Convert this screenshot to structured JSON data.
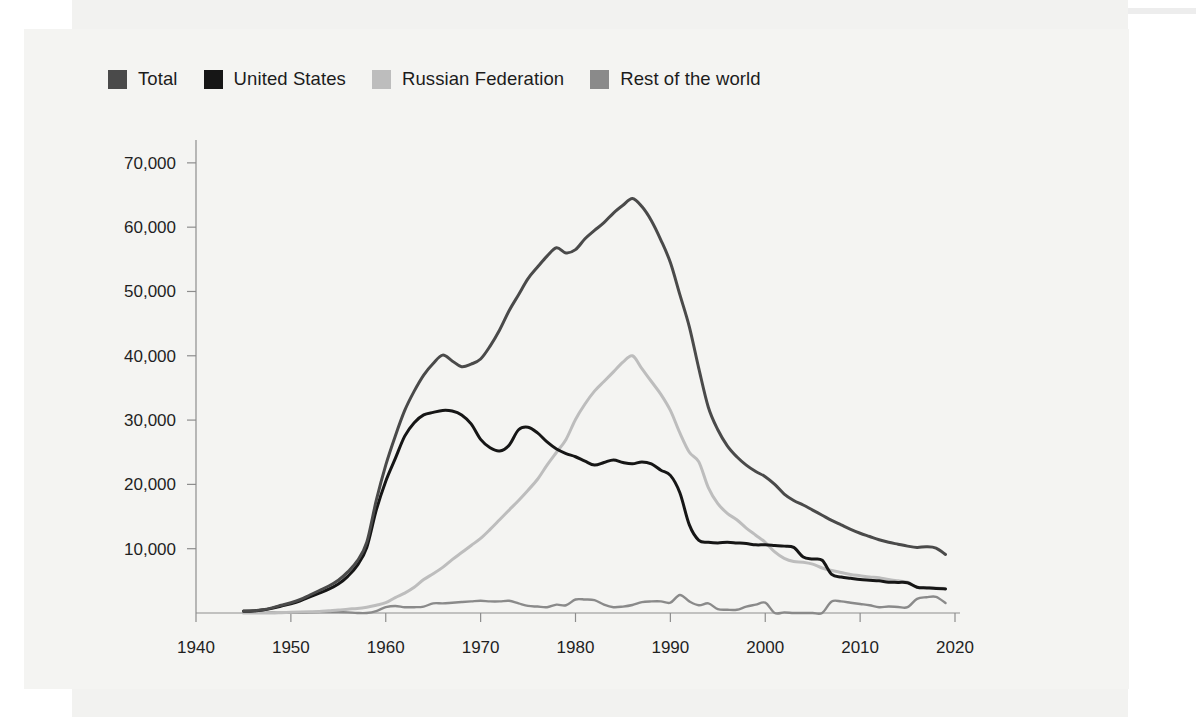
{
  "legend": {
    "position": "top-left",
    "items": [
      {
        "label": "Total",
        "color": "#4a4a4a",
        "key": "total"
      },
      {
        "label": "United States",
        "color": "#161616",
        "key": "united_states"
      },
      {
        "label": "Russian Federation",
        "color": "#bdbdbd",
        "key": "russian_federation"
      },
      {
        "label": "Rest of the world",
        "color": "#8a8a8a",
        "key": "rest_of_world"
      }
    ]
  },
  "axes": {
    "x_ticks": [
      "1940",
      "1950",
      "1960",
      "1970",
      "1980",
      "1990",
      "2000",
      "2010",
      "2020"
    ],
    "y_ticks": [
      "10,000",
      "20,000",
      "30,000",
      "40,000",
      "50,000",
      "60,000",
      "70,000"
    ],
    "xlim": [
      1940,
      2020
    ],
    "ylim": [
      0,
      72000
    ],
    "xlabel": "",
    "ylabel": ""
  },
  "chart_data": {
    "type": "line",
    "title": "",
    "subtitle": "",
    "xlabel": "",
    "ylabel": "",
    "xlim": [
      1940,
      2020
    ],
    "ylim": [
      0,
      72000
    ],
    "grid": false,
    "legend_position": "top-left",
    "x_tick_labels": [
      "1940",
      "1950",
      "1960",
      "1970",
      "1980",
      "1990",
      "2000",
      "2010",
      "2020"
    ],
    "y_tick_labels": [
      "10,000",
      "20,000",
      "30,000",
      "40,000",
      "50,000",
      "60,000",
      "70,000"
    ],
    "x": [
      1945,
      1946,
      1947,
      1948,
      1949,
      1950,
      1951,
      1952,
      1953,
      1954,
      1955,
      1956,
      1957,
      1958,
      1959,
      1960,
      1961,
      1962,
      1963,
      1964,
      1965,
      1966,
      1967,
      1968,
      1969,
      1970,
      1971,
      1972,
      1973,
      1974,
      1975,
      1976,
      1977,
      1978,
      1979,
      1980,
      1981,
      1982,
      1983,
      1984,
      1985,
      1986,
      1987,
      1988,
      1989,
      1990,
      1991,
      1992,
      1993,
      1994,
      1995,
      1996,
      1997,
      1998,
      1999,
      2000,
      2001,
      2002,
      2003,
      2004,
      2005,
      2006,
      2007,
      2008,
      2009,
      2010,
      2011,
      2012,
      2013,
      2014,
      2015,
      2016,
      2017,
      2018,
      2019
    ],
    "series": [
      {
        "name": "Total",
        "color": "#4a4a4a",
        "values": [
          300,
          350,
          500,
          800,
          1200,
          1600,
          2100,
          2800,
          3500,
          4200,
          5100,
          6400,
          8100,
          11000,
          17500,
          23000,
          27500,
          31500,
          34500,
          37000,
          38800,
          40100,
          39200,
          38300,
          38700,
          39500,
          41500,
          44000,
          47000,
          49500,
          52000,
          53800,
          55500,
          56800,
          56000,
          56500,
          58200,
          59500,
          60700,
          62200,
          63400,
          64450,
          63200,
          61000,
          58000,
          54500,
          49500,
          44500,
          38000,
          32000,
          28500,
          26000,
          24300,
          23000,
          22000,
          21200,
          20000,
          18500,
          17500,
          16800,
          16000,
          15200,
          14400,
          13700,
          13000,
          12400,
          11900,
          11400,
          11000,
          10700,
          10400,
          10200,
          10300,
          10100,
          9100
        ]
      },
      {
        "name": "United States",
        "color": "#161616",
        "values": [
          280,
          320,
          450,
          720,
          1100,
          1450,
          1900,
          2500,
          3100,
          3700,
          4500,
          5700,
          7400,
          10200,
          16000,
          20500,
          24000,
          27500,
          29600,
          30800,
          31200,
          31500,
          31400,
          30800,
          29400,
          27000,
          25700,
          25200,
          26100,
          28500,
          28900,
          28000,
          26600,
          25500,
          24800,
          24300,
          23600,
          23000,
          23400,
          23800,
          23400,
          23200,
          23500,
          23200,
          22200,
          21400,
          18700,
          13700,
          11300,
          11000,
          10900,
          11000,
          10900,
          10800,
          10600,
          10600,
          10500,
          10400,
          10200,
          8700,
          8400,
          8200,
          6000,
          5600,
          5400,
          5200,
          5100,
          5000,
          4800,
          4760,
          4700,
          4000,
          3900,
          3800,
          3750
        ]
      },
      {
        "name": "Russian Federation",
        "color": "#bdbdbd",
        "values": [
          0,
          0,
          0,
          0,
          50,
          100,
          150,
          200,
          250,
          350,
          450,
          600,
          700,
          900,
          1200,
          1600,
          2400,
          3100,
          4000,
          5200,
          6100,
          7100,
          8300,
          9400,
          10500,
          11600,
          13000,
          14500,
          16000,
          17500,
          19100,
          20800,
          23000,
          25000,
          27000,
          30100,
          32500,
          34500,
          36000,
          37500,
          39000,
          40000,
          38000,
          36000,
          34000,
          31500,
          28000,
          25000,
          23500,
          19500,
          17000,
          15500,
          14500,
          13200,
          12100,
          11000,
          9500,
          8500,
          8000,
          7900,
          7600,
          7000,
          6600,
          6300,
          6000,
          5800,
          5600,
          5500,
          5200,
          5000,
          4800,
          4000,
          3950,
          3880,
          3800
        ]
      },
      {
        "name": "Rest of the world",
        "color": "#8a8a8a",
        "values": [
          20,
          30,
          50,
          80,
          50,
          50,
          50,
          100,
          150,
          150,
          150,
          100,
          0,
          0,
          300,
          900,
          1100,
          900,
          900,
          1000,
          1500,
          1500,
          1600,
          1700,
          1800,
          1900,
          1800,
          1800,
          1900,
          1500,
          1100,
          1000,
          900,
          1300,
          1200,
          2100,
          2100,
          2000,
          1300,
          900,
          1000,
          1250,
          1700,
          1800,
          1800,
          1600,
          2800,
          1800,
          1200,
          1500,
          600,
          500,
          500,
          1000,
          1300,
          1600,
          0,
          100,
          0,
          0,
          0,
          0,
          1800,
          1800,
          1600,
          1400,
          1200,
          900,
          1000,
          940,
          900,
          2200,
          2450,
          2520,
          1550
        ]
      }
    ]
  }
}
